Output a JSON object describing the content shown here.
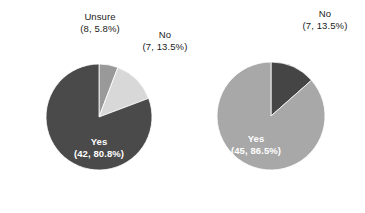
{
  "figure": {
    "background_color": "#ffffff",
    "width": 365,
    "height": 213
  },
  "palette": {
    "dark_gray": "#4a4a4a",
    "medium_gray": "#999999",
    "light_gray": "#d8d8d8",
    "medium_light_gray": "#a8a8a8",
    "label_text": "#1b1b1b",
    "inner_label_text": "#ffffff"
  },
  "charts": [
    {
      "id": "left",
      "name": "left-pie-chart",
      "center_x": 99,
      "center_y": 117,
      "radius": 53,
      "start_angle_deg": 0,
      "direction": "clockwise",
      "labels": {
        "unsure": {
          "line1": "Unsure",
          "line2": "(8, 5.8%)"
        },
        "no": {
          "line1": "No",
          "line2": "(7, 13.5%)"
        },
        "yes": {
          "line1": "Yes",
          "line2": "(42, 80.8%)"
        }
      },
      "slices": [
        {
          "label": "Unsure",
          "count": 8,
          "percent": 5.8,
          "color": "#999999",
          "angle_deg": 20.9
        },
        {
          "label": "No",
          "count": 7,
          "percent": 13.5,
          "color": "#d8d8d8",
          "angle_deg": 48.6
        },
        {
          "label": "Yes",
          "count": 42,
          "percent": 80.8,
          "color": "#4a4a4a",
          "angle_deg": 290.5
        }
      ]
    },
    {
      "id": "right",
      "name": "right-pie-chart",
      "center_x": 271,
      "center_y": 116,
      "radius": 54,
      "start_angle_deg": 0,
      "direction": "clockwise",
      "labels": {
        "no": {
          "line1": "No",
          "line2": "(7, 13.5%)"
        },
        "yes": {
          "line1": "Yes",
          "line2": "(45, 86.5%)"
        }
      },
      "slices": [
        {
          "label": "No",
          "count": 7,
          "percent": 13.5,
          "color": "#454545",
          "angle_deg": 48.6
        },
        {
          "label": "Yes",
          "count": 45,
          "percent": 86.5,
          "color": "#a8a8a8",
          "angle_deg": 311.4
        }
      ]
    }
  ],
  "chart_data": {
    "type": "pie",
    "title": "",
    "subtitle": "",
    "xlabel": "",
    "ylabel": "",
    "grid": false,
    "legend": "none",
    "label_format": "(count, percent%)",
    "panels": [
      {
        "name": "left-pie-chart",
        "total": 52,
        "categories": [
          "Unsure",
          "No",
          "Yes"
        ],
        "values": [
          8,
          7,
          42
        ],
        "percents": [
          5.8,
          13.5,
          80.8
        ],
        "colors": [
          "#999999",
          "#d8d8d8",
          "#4a4a4a"
        ],
        "annotations": [
          "Unsure\n(8, 5.8%)",
          "No\n(7, 13.5%)",
          "Yes\n(42, 80.8%)"
        ],
        "start_angle_deg": 90,
        "counterclock": false
      },
      {
        "name": "right-pie-chart",
        "total": 52,
        "categories": [
          "No",
          "Yes"
        ],
        "values": [
          7,
          45
        ],
        "percents": [
          13.5,
          86.5
        ],
        "colors": [
          "#454545",
          "#a8a8a8"
        ],
        "annotations": [
          "No\n(7, 13.5%)",
          "Yes\n(45, 86.5%)"
        ],
        "start_angle_deg": 90,
        "counterclock": false
      }
    ]
  }
}
